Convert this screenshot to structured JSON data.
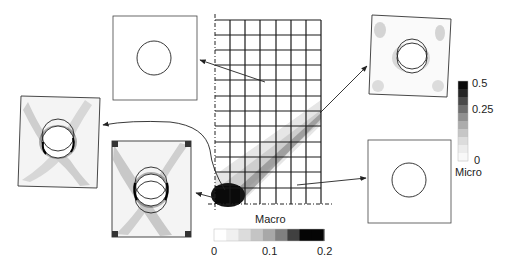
{
  "macro_colorbar": {
    "title": "Macro",
    "ticks": [
      "0",
      "0.1",
      "0.2"
    ],
    "range": [
      0,
      0.2
    ],
    "levels": [
      "#ffffff",
      "#f0f0f0",
      "#dcdcdc",
      "#c4c4c4",
      "#a8a8a8",
      "#808080",
      "#404040",
      "#050505",
      "#050505"
    ]
  },
  "micro_colorbar": {
    "title": "Micro",
    "ticks": [
      "0.5",
      "0.25",
      "0"
    ],
    "range": [
      0,
      0.5
    ],
    "levels": [
      "#0a0a0a",
      "#262626",
      "#4a4a4a",
      "#6e6e6e",
      "#909090",
      "#acacac",
      "#c6c6c6",
      "#dcdcdc",
      "#ececec",
      "#f8f8f8"
    ]
  },
  "macro_mesh": {
    "columns": 7,
    "rows": 12,
    "description": "Macroscale mesh with shear band contour and high-strain zone at bottom-left corner"
  },
  "micro_cells": [
    {
      "id": "top-left",
      "state": "undeformed"
    },
    {
      "id": "middle-left",
      "state": "deformed-sheared"
    },
    {
      "id": "bottom-center-left",
      "state": "deformed-high-strain"
    },
    {
      "id": "top-right",
      "state": "deformed-mild"
    },
    {
      "id": "bottom-right",
      "state": "undeformed"
    }
  ]
}
